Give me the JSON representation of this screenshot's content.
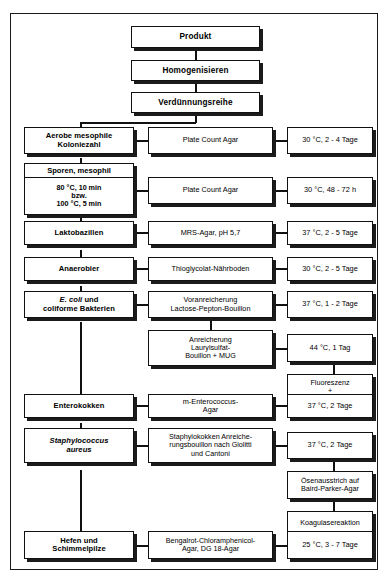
{
  "diagram": {
    "title_flow": "Mikrobiologische Untersuchung - Flussdiagramm",
    "top_chain": [
      {
        "label": "Produkt"
      },
      {
        "label": "Homogenisieren"
      },
      {
        "label": "Verdünnungsreihe"
      }
    ],
    "rows": [
      {
        "organism": "Aerobe mesophile\nKoloniezahl",
        "organism_line1": "Aerobe mesophile",
        "organism_line2": "Koloniezahl",
        "medium": "Plate Count Agar",
        "condition": "30 °C, 2 - 4 Tage"
      },
      {
        "organism_header": "Sporen, mesophil",
        "organism_line1": "80 °C, 10 min",
        "organism_line2": "bzw.",
        "organism_line3": "100 °C, 5 min",
        "medium": "Plate Count Agar",
        "condition": "30 °C, 48 - 72 h"
      },
      {
        "organism_line1": "Laktobazillen",
        "medium": "MRS-Agar, pH 5,7",
        "condition": "37 °C, 2 - 5 Tage"
      },
      {
        "organism_line1": "Anaerobier",
        "medium": "Thioglycolat-Nährboden",
        "condition": "30 °C, 2 - 5 Tage"
      },
      {
        "organism_italic": "E. coli",
        "organism_line1_rest": " und",
        "organism_line2": "coliforme Bakterien",
        "medium_line1": "Voranreicherung",
        "medium_line2": "Lactose-Pepton-Bouillon",
        "condition": "37 °C, 1 - 2 Tage"
      },
      {
        "organism_line1": "Enterokokken",
        "medium_line1": "m-Enterococcus-",
        "medium_line2": "Agar",
        "condition": "37 °C, 2 Tage"
      },
      {
        "organism_italic": "Staphylococcus",
        "organism_line2": "aureus",
        "medium_line1": "Staphylokokken Anreiche-",
        "medium_line2": "rungsbouillon nach Giolitti",
        "medium_line3": "und Cantoni",
        "condition": "37 °C, 2 Tage"
      },
      {
        "organism_line1": "Hefen und",
        "organism_line2": "Schimmelpilze",
        "medium_line1": "Bengalrot-Chloramphenicol-",
        "medium_line2": "Agar, DG 18-Agar",
        "condition": "25 °C, 3 - 7 Tage"
      }
    ],
    "ecoli_sub": {
      "medium_line1": "Anreicherung",
      "medium_line2": "Laurylsulfat-",
      "medium_line3": "Bouillon + MUG",
      "condition": "44 °C, 1 Tag",
      "result_line1": "Fluoreszenz",
      "result_line2": "+",
      "result_line3": "Indol"
    },
    "staph_sub": {
      "step1_line1": "Ösenausstrich auf",
      "step1_line2": "Baird-Parker-Agar",
      "step2": "Koagulasereaktion"
    },
    "colors": {
      "ink": "#111111",
      "shadow": "#1b1b1b",
      "paper": "#ffffff"
    }
  }
}
